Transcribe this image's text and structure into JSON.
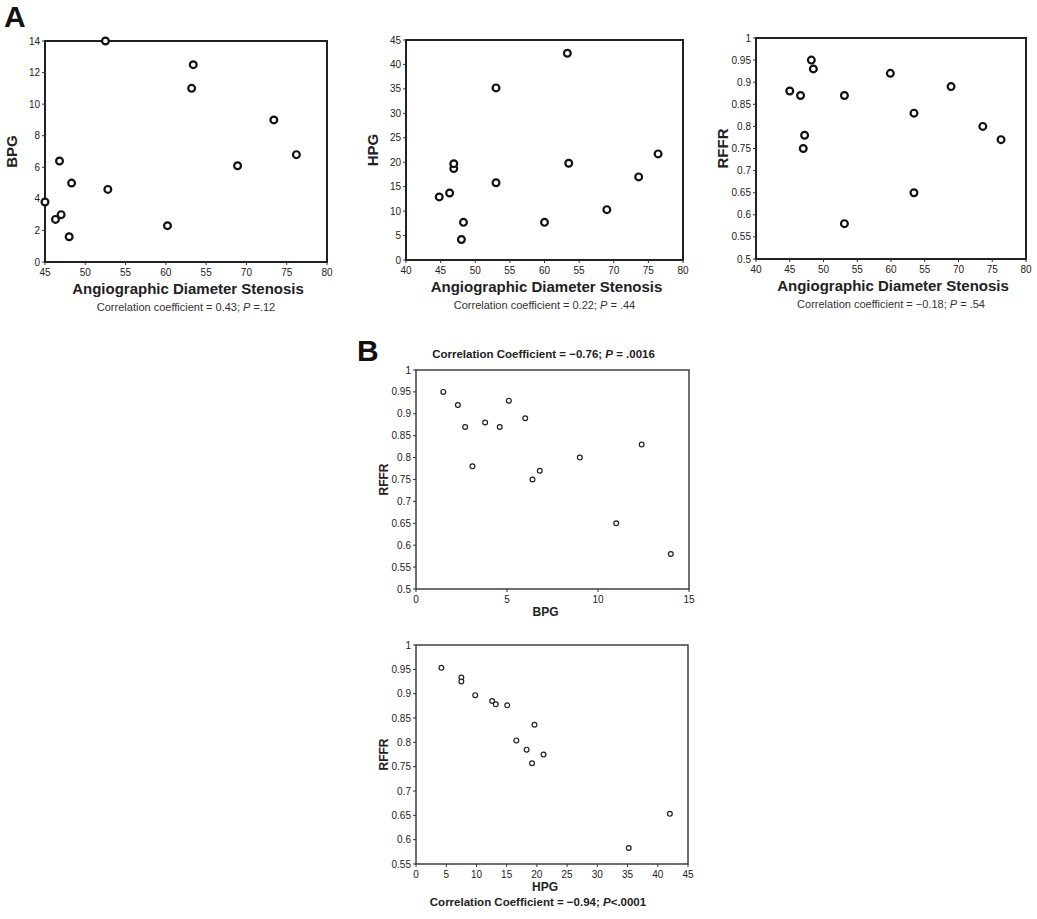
{
  "panels": {
    "A": {
      "label": "A"
    },
    "B": {
      "label": "B"
    }
  },
  "chart_data": [
    {
      "id": "A1",
      "type": "scatter",
      "panel": "A",
      "title": "",
      "xlabel": "Angiographic Diameter Stenosis",
      "ylabel": "BPG",
      "caption": "Correlation coefficient = 0.43; P =.12",
      "xlim": [
        45,
        80
      ],
      "ylim": [
        0,
        14
      ],
      "xticks": [
        45,
        50,
        55,
        60,
        55,
        70,
        75,
        80
      ],
      "xtick_values": [
        45,
        50,
        55,
        60,
        65,
        70,
        75,
        80
      ],
      "yticks": [
        0,
        2,
        4,
        6,
        8,
        10,
        12,
        14
      ],
      "grid": false,
      "frame": {
        "left": 45,
        "top": 41,
        "right": 327,
        "bottom": 262
      },
      "marker": "bold",
      "x": [
        45.0,
        46.3,
        47.0,
        46.8,
        48.0,
        48.3,
        52.5,
        52.8,
        60.2,
        63.2,
        63.4,
        68.9,
        73.4,
        76.2
      ],
      "y": [
        3.8,
        2.7,
        3.0,
        6.4,
        1.6,
        5.0,
        14.0,
        4.6,
        2.3,
        11.0,
        12.5,
        6.1,
        9.0,
        6.8
      ]
    },
    {
      "id": "A2",
      "type": "scatter",
      "panel": "A",
      "title": "",
      "xlabel": "Angiographic Diameter Stenosis",
      "ylabel": "HPG",
      "caption": "Correlation coefficient = 0.22; P = .44",
      "xlim": [
        40,
        80
      ],
      "ylim": [
        0,
        45
      ],
      "xticks": [
        40,
        45,
        50,
        55,
        60,
        55,
        70,
        75,
        80
      ],
      "xtick_values": [
        40,
        45,
        50,
        55,
        60,
        65,
        70,
        75,
        80
      ],
      "yticks": [
        0,
        5,
        10,
        15,
        20,
        25,
        30,
        35,
        40,
        45
      ],
      "grid": false,
      "frame": {
        "left": 406,
        "top": 40,
        "right": 683,
        "bottom": 260
      },
      "marker": "bold",
      "x": [
        44.8,
        46.3,
        46.9,
        46.9,
        48.3,
        48.0,
        53.0,
        53.0,
        60.0,
        63.3,
        63.5,
        69.0,
        73.6,
        76.4
      ],
      "y": [
        12.9,
        13.7,
        18.7,
        19.7,
        7.7,
        4.2,
        35.2,
        15.8,
        7.7,
        42.3,
        19.8,
        10.3,
        17.0,
        21.7
      ]
    },
    {
      "id": "A3",
      "type": "scatter",
      "panel": "A",
      "title": "",
      "xlabel": "Angiographic Diameter Stenosis",
      "ylabel": "RFFR",
      "caption": "Correlation coefficient = −0.18; P = .54",
      "xlim": [
        40,
        80
      ],
      "ylim": [
        0.5,
        1
      ],
      "xticks": [
        40,
        45,
        50,
        55,
        60,
        55,
        70,
        75,
        80
      ],
      "xtick_values": [
        40,
        45,
        50,
        55,
        60,
        65,
        70,
        75,
        80
      ],
      "yticks": [
        0.5,
        0.55,
        0.6,
        0.65,
        0.7,
        0.75,
        0.8,
        0.85,
        0.9,
        0.95,
        1
      ],
      "grid": false,
      "frame": {
        "left": 756,
        "top": 38,
        "right": 1026,
        "bottom": 259
      },
      "marker": "bold",
      "x": [
        45.0,
        46.6,
        47.0,
        47.2,
        48.2,
        48.5,
        53.1,
        53.1,
        59.9,
        63.4,
        63.4,
        68.9,
        73.6,
        76.3
      ],
      "y": [
        0.88,
        0.87,
        0.75,
        0.78,
        0.95,
        0.93,
        0.87,
        0.58,
        0.92,
        0.83,
        0.65,
        0.89,
        0.8,
        0.77
      ]
    },
    {
      "id": "B1",
      "type": "scatter",
      "panel": "B",
      "title": "Correlation Coefficient = −0.76; P = .0016",
      "xlabel": "BPG",
      "ylabel": "RFFR",
      "caption": "",
      "xlim": [
        0,
        15
      ],
      "ylim": [
        0.5,
        1
      ],
      "xticks": [
        0,
        5,
        10,
        15
      ],
      "xtick_values": [
        0,
        5,
        10,
        15
      ],
      "yticks": [
        0.5,
        0.55,
        0.6,
        0.65,
        0.7,
        0.75,
        0.8,
        0.85,
        0.9,
        0.95,
        1
      ],
      "grid": false,
      "frame": {
        "left": 416,
        "top": 370,
        "right": 689,
        "bottom": 589
      },
      "marker": "thin",
      "x": [
        1.5,
        2.3,
        2.7,
        3.1,
        3.8,
        4.6,
        5.1,
        6.0,
        6.4,
        6.8,
        9.0,
        11.0,
        12.4,
        14.0
      ],
      "y": [
        0.95,
        0.92,
        0.87,
        0.78,
        0.88,
        0.87,
        0.93,
        0.89,
        0.75,
        0.77,
        0.8,
        0.65,
        0.83,
        0.58
      ]
    },
    {
      "id": "B2",
      "type": "scatter",
      "panel": "B",
      "title": "",
      "xlabel": "HPG",
      "ylabel": "RFFR",
      "caption": "Correlation Coefficient = −0.94; P<.0001",
      "xlim": [
        0,
        45
      ],
      "ylim": [
        0.55,
        1
      ],
      "xticks": [
        0,
        5,
        10,
        15,
        20,
        25,
        30,
        35,
        40,
        45
      ],
      "xtick_values": [
        0,
        5,
        10,
        15,
        20,
        25,
        30,
        35,
        40,
        45
      ],
      "yticks": [
        0.55,
        0.6,
        0.65,
        0.7,
        0.75,
        0.8,
        0.85,
        0.9,
        0.95,
        1
      ],
      "grid": false,
      "frame": {
        "left": 416,
        "top": 645,
        "right": 688,
        "bottom": 864
      },
      "marker": "thin",
      "x": [
        4.2,
        7.5,
        7.5,
        9.8,
        12.6,
        13.2,
        15.1,
        16.6,
        18.3,
        19.2,
        19.6,
        21.1,
        35.2,
        42.0
      ],
      "y": [
        0.953,
        0.933,
        0.925,
        0.897,
        0.885,
        0.878,
        0.876,
        0.804,
        0.785,
        0.757,
        0.836,
        0.775,
        0.583,
        0.653
      ]
    }
  ]
}
